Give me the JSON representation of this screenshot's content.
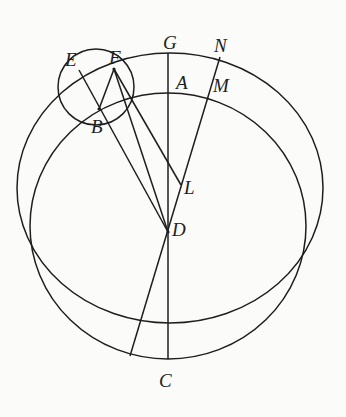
{
  "diagram": {
    "type": "geometric-construction",
    "stroke_color": "#1e1e1e",
    "background": "#fbfbfa",
    "labels": {
      "E": "E",
      "F": "F",
      "G": "G",
      "N": "N",
      "A": "A",
      "M": "M",
      "B": "B",
      "L": "L",
      "D": "D",
      "C": "C"
    },
    "elements": {
      "circles": [
        "outer circle through G, N, F",
        "inner circle through A, M, C",
        "small circle through E, F, B"
      ],
      "lines": [
        "G-C vertical through A and D",
        "N-M-D extended",
        "F-D",
        "F-B",
        "E-B-D",
        "F-L"
      ]
    }
  }
}
